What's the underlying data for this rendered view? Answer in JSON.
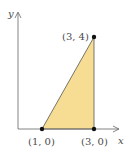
{
  "diagram": {
    "type": "coordinate-plane-region",
    "axes": {
      "x_label": "x",
      "y_label": "y"
    },
    "region": {
      "fill": "#f7dc93",
      "stroke": "#555555",
      "vertices": [
        [
          1,
          0
        ],
        [
          3,
          0
        ],
        [
          3,
          4
        ]
      ]
    },
    "points": [
      {
        "label": "(1, 0)",
        "x": 1,
        "y": 0
      },
      {
        "label": "(3, 0)",
        "x": 3,
        "y": 0
      },
      {
        "label": "(3, 4)",
        "x": 3,
        "y": 4
      }
    ]
  }
}
